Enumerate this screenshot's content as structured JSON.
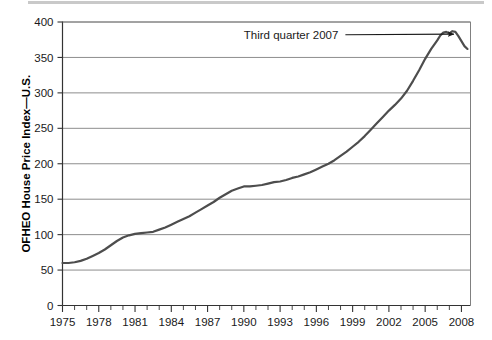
{
  "chart_data": {
    "type": "line",
    "title": "",
    "xlabel": "",
    "ylabel": "OFHEO House Price Index—U.S.",
    "xlim": [
      1975,
      2008.75
    ],
    "ylim": [
      0,
      400
    ],
    "ytick_labels": [
      "0",
      "50",
      "100",
      "150",
      "200",
      "250",
      "300",
      "350",
      "400"
    ],
    "ytick_values": [
      0,
      50,
      100,
      150,
      200,
      250,
      300,
      350,
      400
    ],
    "xtick_labels": [
      "1975",
      "1978",
      "1981",
      "1984",
      "1987",
      "1990",
      "1993",
      "1996",
      "1999",
      "2002",
      "2005",
      "2008"
    ],
    "xtick_values": [
      1975,
      1978,
      1981,
      1984,
      1987,
      1990,
      1993,
      1996,
      1999,
      2002,
      2005,
      2008
    ],
    "x_minor_tick_interval": 1,
    "grid": "horizontal",
    "grid_color": "#808080",
    "legend": "none",
    "line_color": "#4d4d4d",
    "line_width": 2.2,
    "annotations": [
      {
        "text": "Third quarter 2007",
        "points_to_x": 2007.5,
        "points_to_y": 385,
        "label_x": 1998.4,
        "label_y": 382
      }
    ],
    "series": [
      {
        "name": "OFHEO House Price Index—U.S.",
        "x": [
          1975.0,
          1975.5,
          1976.0,
          1976.5,
          1977.0,
          1977.5,
          1978.0,
          1978.5,
          1979.0,
          1979.5,
          1980.0,
          1980.5,
          1981.0,
          1981.5,
          1982.0,
          1982.5,
          1983.0,
          1983.5,
          1984.0,
          1984.5,
          1985.0,
          1985.5,
          1986.0,
          1986.5,
          1987.0,
          1987.5,
          1988.0,
          1988.5,
          1989.0,
          1989.5,
          1990.0,
          1990.5,
          1991.0,
          1991.5,
          1992.0,
          1992.5,
          1993.0,
          1993.5,
          1994.0,
          1994.5,
          1995.0,
          1995.5,
          1996.0,
          1996.5,
          1997.0,
          1997.5,
          1998.0,
          1998.5,
          1999.0,
          1999.5,
          2000.0,
          2000.5,
          2001.0,
          2001.5,
          2002.0,
          2002.5,
          2003.0,
          2003.5,
          2004.0,
          2004.5,
          2005.0,
          2005.5,
          2006.0,
          2006.25,
          2006.5,
          2006.75,
          2007.0,
          2007.25,
          2007.5,
          2007.75,
          2008.0,
          2008.25,
          2008.5
        ],
        "y": [
          60,
          60,
          61,
          63,
          66,
          70,
          74,
          79,
          85,
          91,
          96,
          99,
          101,
          102,
          103,
          104,
          107,
          110,
          114,
          118,
          122,
          126,
          131,
          136,
          141,
          146,
          152,
          157,
          162,
          165,
          168,
          168,
          169,
          170,
          172,
          174,
          175,
          177,
          180,
          182,
          185,
          188,
          192,
          196,
          200,
          205,
          211,
          217,
          224,
          231,
          239,
          248,
          257,
          266,
          275,
          283,
          292,
          303,
          317,
          332,
          348,
          362,
          374,
          381,
          385,
          386,
          384,
          387,
          386,
          380,
          373,
          366,
          362
        ]
      }
    ]
  },
  "axis": {
    "y_title": "OFHEO House Price Index—U.S."
  }
}
